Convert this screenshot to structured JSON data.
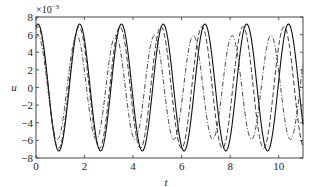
{
  "chart_data": {
    "type": "line",
    "title": "",
    "xlabel": "t",
    "ylabel": "u",
    "y_scale_label": "×10",
    "y_scale_exponent": "−3",
    "xlim": [
      0,
      11
    ],
    "ylim": [
      -8,
      8
    ],
    "xticks": [
      0,
      2,
      4,
      6,
      8,
      10
    ],
    "xtick_labels": [
      "0",
      "2",
      "4",
      "6",
      "8",
      "10"
    ],
    "yticks": [
      8,
      6,
      4,
      2,
      0,
      -2,
      -4,
      -6,
      -8
    ],
    "ytick_labels": [
      "8",
      "6",
      "4",
      "2",
      "0",
      "−2",
      "−4",
      "−6",
      "−8"
    ],
    "grid": false,
    "legend": null,
    "series": [
      {
        "name": "solid",
        "style": "solid",
        "color": "#111111",
        "model": {
          "amplitude": 7.2,
          "period": 1.72,
          "peak_t0": 0.08,
          "period_drift": 0.0
        },
        "peaks_t": [
          0.08,
          1.78,
          3.5,
          5.2,
          6.94,
          8.68,
          10.45
        ],
        "peak_value": 7.2,
        "trough_value": -7.4
      },
      {
        "name": "dashed",
        "style": "dashed",
        "color": "#222222",
        "model": {
          "amplitude": 6.9,
          "period": 1.69,
          "peak_t0": 0.08,
          "period_drift": 0.0
        },
        "peak_value": 6.8,
        "trough_value": -7.0
      },
      {
        "name": "dash-dot",
        "style": "dashdot",
        "color": "#333333",
        "model": {
          "amplitude": 5.9,
          "period": 1.6,
          "peak_t0": 0.08,
          "period_drift": 0.0
        },
        "peak_value": 5.6,
        "trough_value": -6.2
      }
    ]
  }
}
